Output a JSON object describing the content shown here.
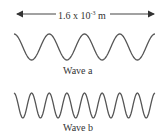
{
  "figure": {
    "measurement": {
      "mantissa": "1.6 x 10",
      "exponent": "-3",
      "unit": " m",
      "span_px": [
        16,
        155
      ]
    },
    "waves": [
      {
        "label": "Wave a",
        "cycles": 4,
        "x_start": 14,
        "x_end": 155,
        "y_top": 34,
        "y_bottom": 60
      },
      {
        "label": "Wave b",
        "cycles": 8,
        "x_start": 14,
        "x_end": 155,
        "y_top": 93,
        "y_bottom": 118
      }
    ],
    "colors": {
      "line": "#555555",
      "arrow": "#333333",
      "text": "#333333"
    }
  }
}
